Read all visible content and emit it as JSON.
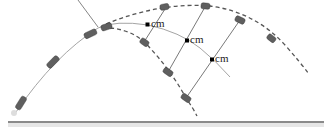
{
  "diagram": {
    "labels": {
      "cm1": "cm",
      "cm2": "cm",
      "cm3": "cm"
    },
    "colors": {
      "trajectory": "#9a9a9a",
      "dashed_fragments": "#555555",
      "fragment_fill": "#5f5f5f",
      "cm_point": "#000000",
      "ground": "#8a8a8a",
      "connector": "#555555"
    },
    "elements": {
      "projectile_path": "solid parabolic path of original projectile and its center of mass",
      "fragment_path_upper": "dashed path of upper fragment",
      "fragment_path_lower": "dashed path of lower fragment",
      "ground": "horizontal ground line"
    }
  }
}
